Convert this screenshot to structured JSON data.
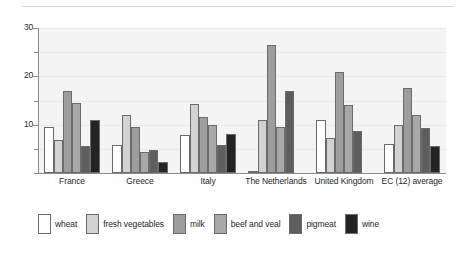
{
  "chart_data": {
    "type": "bar",
    "title": "",
    "xlabel": "",
    "ylabel": "",
    "ylim": [
      0,
      30
    ],
    "yticks": [
      0,
      5,
      10,
      15,
      20,
      25,
      30
    ],
    "ytick_labels": [
      "",
      "",
      "10",
      "",
      "20",
      "",
      "30"
    ],
    "grid": true,
    "legend_position": "bottom",
    "categories": [
      "France",
      "Greece",
      "Italy",
      "The Netherlands",
      "United Kingdom",
      "EC (12) average"
    ],
    "series": [
      {
        "name": "wheat",
        "color": "#ffffff",
        "values": [
          9.5,
          5.8,
          7.8,
          0.5,
          11.0,
          6.0
        ]
      },
      {
        "name": "fresh vegetables",
        "color": "#d2d2d2",
        "values": [
          6.8,
          12.0,
          14.3,
          11.0,
          7.2,
          10.0
        ]
      },
      {
        "name": "milk",
        "color": "#9d9d9d",
        "values": [
          17.0,
          9.5,
          11.5,
          26.5,
          21.0,
          17.5
        ]
      },
      {
        "name": "beef and veal",
        "color": "#a8a8a8",
        "values": [
          14.5,
          4.3,
          10.0,
          9.5,
          14.0,
          12.0
        ]
      },
      {
        "name": "pigmeat",
        "color": "#5e5e5e",
        "values": [
          5.5,
          4.8,
          5.8,
          17.0,
          8.7,
          9.3
        ]
      },
      {
        "name": "wine",
        "color": "#232323",
        "values": [
          11.0,
          2.3,
          8.0,
          0.0,
          0.0,
          5.5
        ]
      }
    ]
  },
  "legend": {
    "items": [
      {
        "label": "wheat",
        "color": "#ffffff"
      },
      {
        "label": "fresh vegetables",
        "color": "#d2d2d2"
      },
      {
        "label": "milk",
        "color": "#9d9d9d"
      },
      {
        "label": "beef and veal",
        "color": "#a8a8a8"
      },
      {
        "label": "pigmeat",
        "color": "#5e5e5e"
      },
      {
        "label": "wine",
        "color": "#232323"
      }
    ]
  },
  "style": {
    "plot_background": "#f4f4f4",
    "axis_color": "#8a8a8a",
    "grid_color": "#e9e9e9",
    "bar_outline": "#6b6b6b",
    "page_background": "#ffffff",
    "rule_color": "#d4d4d4"
  }
}
